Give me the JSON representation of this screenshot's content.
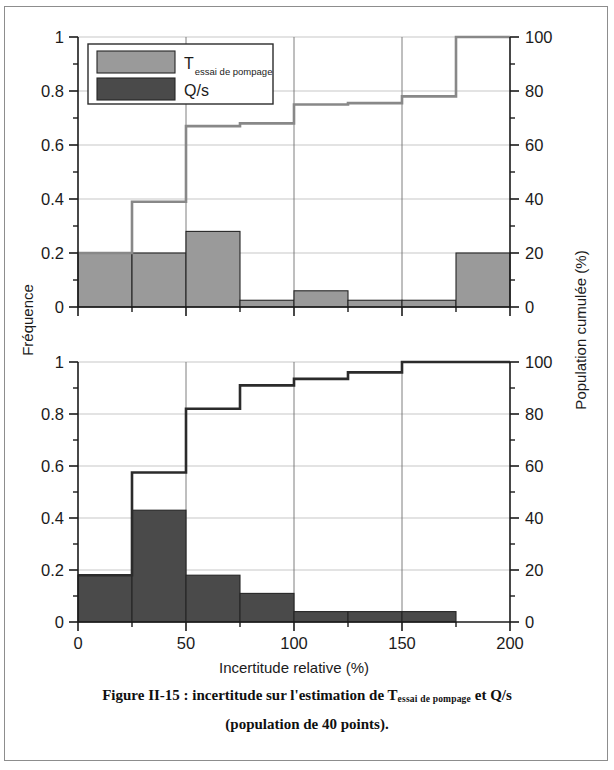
{
  "figure": {
    "caption_line1_a": "Figure II-15 : incertitude sur l'estimation de T",
    "caption_line1_sub": "essai de pompage",
    "caption_line1_b": " et Q/s",
    "caption_line2": "(population de 40 points)."
  },
  "axes": {
    "xlabel": "Incertitude relative  (%)",
    "ylabel_left": "Fréquence",
    "ylabel_right": "Population cumulée (%)",
    "x_ticks": [
      "0",
      "50",
      "100",
      "150",
      "200"
    ],
    "y_left_ticks": [
      "0",
      "0.2",
      "0.4",
      "0.6",
      "0.8",
      "1"
    ],
    "y_right_ticks": [
      "0",
      "20",
      "40",
      "60",
      "80",
      "100"
    ],
    "xlim": [
      0,
      200
    ],
    "ylim_left": [
      0,
      1
    ],
    "ylim_right": [
      0,
      100
    ]
  },
  "legend": {
    "items": [
      {
        "label": "T",
        "sub": "essai de pompage",
        "color": "#9a9a9a"
      },
      {
        "label": "Q/s",
        "sub": "",
        "color": "#4a4a4a"
      }
    ]
  },
  "colors": {
    "bar_top": "#9a9a9a",
    "bar_bottom": "#4a4a4a",
    "line_top": "#888888",
    "line_bottom": "#2b2b2b",
    "axis": "#1b1b1b",
    "grid": "#b9b9b9",
    "frame": "#8d8d8d"
  },
  "chart_data": [
    {
      "type": "bar",
      "id": "top-panel",
      "title": "",
      "series_name": "T essai de pompage",
      "xlabel": "Incertitude relative  (%)",
      "ylabel": "Fréquence",
      "ylabel_secondary": "Population cumulée (%)",
      "xlim": [
        0,
        200
      ],
      "ylim": [
        0,
        1
      ],
      "ylim_secondary": [
        0,
        100
      ],
      "grid": true,
      "legend_position": "upper-left",
      "bin_edges": [
        0,
        25,
        50,
        75,
        100,
        125,
        150,
        175,
        200
      ],
      "bin_centers": [
        12.5,
        37.5,
        62.5,
        87.5,
        112.5,
        137.5,
        162.5,
        187.5
      ],
      "values": [
        0.2,
        0.2,
        0.28,
        0.025,
        0.06,
        0.025,
        0.025,
        0.2
      ],
      "cumulative": {
        "type": "line",
        "name": "Population cumulée",
        "x": [
          0,
          25,
          50,
          75,
          100,
          125,
          150,
          175,
          200
        ],
        "values_fraction": [
          0.2,
          0.39,
          0.67,
          0.68,
          0.75,
          0.755,
          0.78,
          1.0,
          1.0
        ],
        "values_percent": [
          20,
          39,
          67,
          68,
          75,
          75.5,
          78,
          100,
          100
        ]
      }
    },
    {
      "type": "bar",
      "id": "bottom-panel",
      "title": "",
      "series_name": "Q/s",
      "xlabel": "Incertitude relative  (%)",
      "ylabel": "Fréquence",
      "ylabel_secondary": "Population cumulée (%)",
      "xlim": [
        0,
        200
      ],
      "ylim": [
        0,
        1
      ],
      "ylim_secondary": [
        0,
        100
      ],
      "grid": true,
      "legend_position": "none",
      "bin_edges": [
        0,
        25,
        50,
        75,
        100,
        125,
        150,
        175,
        200
      ],
      "bin_centers": [
        12.5,
        37.5,
        62.5,
        87.5,
        112.5,
        137.5,
        162.5,
        187.5
      ],
      "values": [
        0.18,
        0.43,
        0.18,
        0.11,
        0.04,
        0.04,
        0.04,
        0.0
      ],
      "cumulative": {
        "type": "line",
        "name": "Population cumulée",
        "x": [
          0,
          25,
          50,
          75,
          100,
          125,
          150,
          175,
          200
        ],
        "values_fraction": [
          0.18,
          0.575,
          0.82,
          0.91,
          0.935,
          0.96,
          1.0,
          1.0,
          1.0
        ],
        "values_percent": [
          18,
          57.5,
          82,
          91,
          93.5,
          96,
          100,
          100,
          100
        ]
      }
    }
  ]
}
